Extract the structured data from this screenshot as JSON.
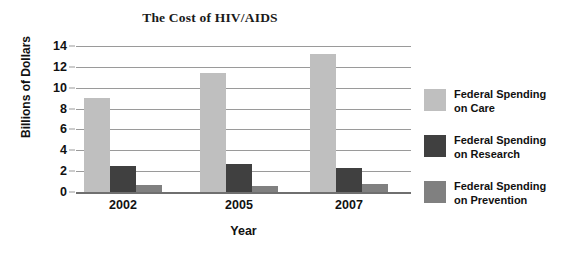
{
  "chart_data": {
    "type": "bar",
    "title": "The Cost of HIV/AIDS",
    "xlabel": "Year",
    "ylabel": "Billions of Dollars",
    "categories": [
      "2002",
      "2005",
      "2007"
    ],
    "ylim": [
      0,
      14
    ],
    "yticks": [
      0,
      2,
      4,
      6,
      8,
      10,
      12,
      14
    ],
    "grid": true,
    "legend_position": "right",
    "series": [
      {
        "name": "Federal Spending on Care",
        "name_line1": "Federal Spending",
        "name_line2": "on Care",
        "color": "#bfbfbf",
        "values": [
          9.0,
          11.4,
          13.2
        ]
      },
      {
        "name": "Federal Spending on Research",
        "name_line1": "Federal Spending",
        "name_line2": "on Research",
        "color": "#404040",
        "values": [
          2.5,
          2.65,
          2.3
        ]
      },
      {
        "name": "Federal Spending on Prevention",
        "name_line1": "Federal Spending",
        "name_line2": "on Prevention",
        "color": "#808080",
        "values": [
          0.65,
          0.55,
          0.75
        ]
      }
    ]
  }
}
